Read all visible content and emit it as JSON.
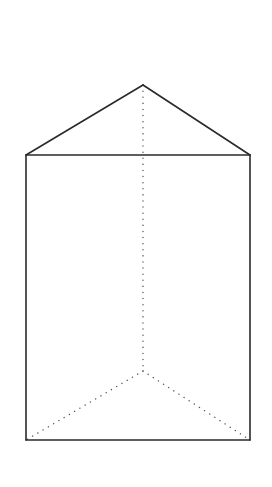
{
  "diagram": {
    "colors": {
      "background": "#ffffff",
      "visible_edge": "#2a2a2a",
      "hidden_edge": "#555555"
    },
    "vertices": {
      "top_apex_back": [
        143,
        85
      ],
      "top_left_front": [
        26,
        155
      ],
      "top_right_front": [
        250,
        155
      ],
      "bottom_apex_back": [
        143,
        371
      ],
      "bottom_left_front": [
        26,
        440
      ],
      "bottom_right_front": [
        250,
        440
      ]
    },
    "visible_edges": [
      {
        "name": "top-left-slant",
        "from": "top_left_front",
        "to": "top_apex_back"
      },
      {
        "name": "top-right-slant",
        "from": "top_apex_back",
        "to": "top_right_front"
      },
      {
        "name": "top-front",
        "from": "top_left_front",
        "to": "top_right_front"
      },
      {
        "name": "left-vertical",
        "from": "top_left_front",
        "to": "bottom_left_front"
      },
      {
        "name": "right-vertical",
        "from": "top_right_front",
        "to": "bottom_right_front"
      },
      {
        "name": "bottom-front",
        "from": "bottom_left_front",
        "to": "bottom_right_front"
      }
    ],
    "hidden_edges": [
      {
        "name": "back-vertical",
        "from": "top_apex_back",
        "to": "bottom_apex_back"
      },
      {
        "name": "bottom-left-slant",
        "from": "bottom_apex_back",
        "to": "bottom_left_front"
      },
      {
        "name": "bottom-right-slant",
        "from": "bottom_apex_back",
        "to": "bottom_right_front"
      }
    ]
  }
}
